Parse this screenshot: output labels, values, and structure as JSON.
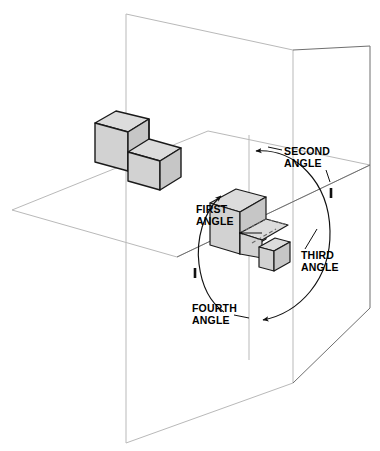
{
  "diagram": {
    "background_color": "#ffffff",
    "labels": [
      {
        "id": "second-angle",
        "line1": "SECOND",
        "line2": "ANGLE",
        "x": 284,
        "y": 155,
        "anchor": "start"
      },
      {
        "id": "first-angle",
        "line1": "FIRST",
        "line2": "ANGLE",
        "x": 196,
        "y": 213,
        "anchor": "start"
      },
      {
        "id": "third-angle",
        "line1": "THIRD",
        "line2": "ANGLE",
        "x": 301,
        "y": 259,
        "anchor": "start"
      },
      {
        "id": "fourth-angle",
        "line1": "FOURTH",
        "line2": "ANGLE",
        "x": 192,
        "y": 312,
        "anchor": "start"
      }
    ],
    "planes": {
      "vertical_plane": {
        "name": "vertical-projection-plane",
        "stroke": "#b9b9b9",
        "points": "126,14 126,443 293,383 293,50"
      },
      "horizontal_plane": {
        "name": "horizontal-projection-plane",
        "stroke": "#b9b9b9",
        "points": "12,210 208,131 370,165 177,257"
      },
      "vertical_plane_right": {
        "name": "vertical-plane-right-wing",
        "stroke": "#6f6f6f",
        "points": "293,50 370,46 370,308 293,383"
      }
    },
    "solids": {
      "l_block": {
        "name": "l-shaped-object-first-angle-position",
        "fill_top": "#dcdcdc",
        "fill_left": "#d2d2d2",
        "fill_right": "#c6c6c6"
      },
      "center_block": {
        "name": "object-projected-center",
        "fill_top": "#dcdcdc",
        "fill_left": "#d2d2d2",
        "fill_right": "#c6c6c6"
      },
      "small_block": {
        "name": "object-projected-third-angle",
        "fill_top": "#dcdcdc",
        "fill_left": "#d2d2d2",
        "fill_right": "#c6c6c6"
      }
    },
    "rotation_arcs": {
      "stroke": "#111111",
      "description": "Two arcs with arrowheads showing rotation direction around the fold line between the quadrants"
    }
  }
}
